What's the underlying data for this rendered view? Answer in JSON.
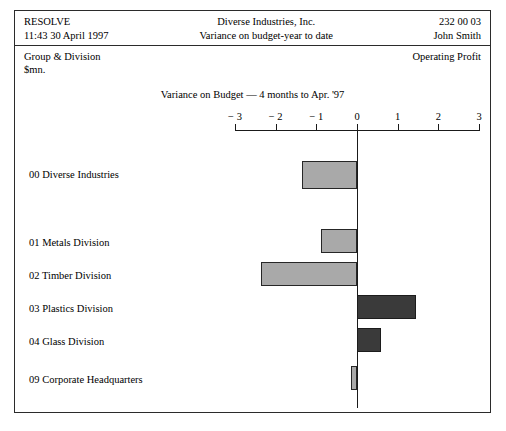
{
  "header": {
    "left_line1": "RESOLVE",
    "left_line2": "11:43 30 April 1997",
    "center_line1": "Diverse  Industries, Inc.",
    "center_line2": "Variance on budget-year to date",
    "right_line1": "232 00 03",
    "right_line2": "John Smith"
  },
  "subheader": {
    "group_division_line1": "Group & Division",
    "group_division_line2": "$mn.",
    "operating_profit": "Operating Profit"
  },
  "chart_data": {
    "type": "bar",
    "orientation": "horizontal",
    "title": "Variance on Budget — 4 months to Apr. '97",
    "xlabel": "",
    "ylabel": "",
    "xlim": [
      -3,
      3
    ],
    "xticks": [
      -3,
      -2,
      -1,
      0,
      1,
      2,
      3
    ],
    "xtick_labels": [
      "− 3",
      "− 2",
      "− 1",
      "0",
      "1",
      "2",
      "3"
    ],
    "grid": false,
    "legend": "none",
    "units": "$mn.",
    "categories": [
      "00 Diverse Industries",
      "01 Metals Division",
      "02 Timber Division",
      "03 Plastics Division",
      "04 Glass Division",
      "09 Corporate Headquarters"
    ],
    "values": [
      -1.35,
      -0.88,
      -2.36,
      1.45,
      0.6,
      -0.15
    ],
    "colors": {
      "negative": "#a9a9a9",
      "positive": "#3a3a3a",
      "axis": "#1a1a1a",
      "frame": "#2b2b2b"
    }
  }
}
